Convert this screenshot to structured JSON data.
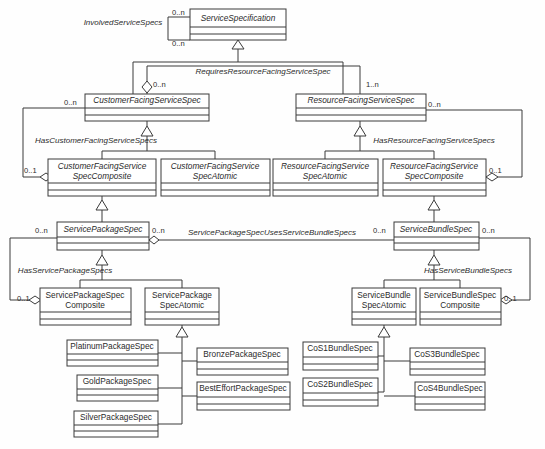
{
  "diagram": {
    "type": "uml-class-diagram",
    "background_color": "#fefefe",
    "line_color": "#3a3a3a",
    "classes": [
      {
        "id": "service-specification",
        "name": "ServiceSpecification",
        "abstract": true,
        "x": 190,
        "y": 9,
        "w": 96,
        "h": 31,
        "lines": [
          "ServiceSpecification"
        ]
      },
      {
        "id": "customer-facing-service-spec",
        "name": "CustomerFacingServiceSpec",
        "abstract": true,
        "x": 85,
        "y": 94,
        "w": 124,
        "h": 27,
        "lines": [
          "CustomerFacingServiceSpec"
        ]
      },
      {
        "id": "resource-facing-service-spec",
        "name": "ResourceFacingServiceSpec",
        "abstract": true,
        "x": 296,
        "y": 94,
        "w": 130,
        "h": 27,
        "lines": [
          "ResourceFacingServiceSpec"
        ]
      },
      {
        "id": "customer-facing-service-spec-composite",
        "name": "CustomerFacingServiceSpecComposite",
        "abstract": true,
        "x": 48,
        "y": 159,
        "w": 108,
        "h": 37,
        "lines": [
          "CustomerFacingService",
          "SpecComposite"
        ]
      },
      {
        "id": "customer-facing-service-spec-atomic",
        "name": "CustomerFacingServiceSpecAtomic",
        "abstract": true,
        "x": 161,
        "y": 159,
        "w": 109,
        "h": 37,
        "lines": [
          "CustomerFacingService",
          "SpecAtomic"
        ]
      },
      {
        "id": "resource-facing-service-spec-atomic",
        "name": "ResourceFacingServiceSpecAtomic",
        "abstract": true,
        "x": 273,
        "y": 159,
        "w": 105,
        "h": 37,
        "lines": [
          "ResourceFacingService",
          "SpecAtomic"
        ]
      },
      {
        "id": "resource-facing-service-spec-composite",
        "name": "ResourceFacingServiceSpecComposite",
        "abstract": true,
        "x": 383,
        "y": 159,
        "w": 103,
        "h": 37,
        "lines": [
          "ResourceFacingService",
          "SpecComposite"
        ]
      },
      {
        "id": "service-package-spec",
        "name": "ServicePackageSpec",
        "abstract": true,
        "x": 57,
        "y": 222,
        "w": 92,
        "h": 28,
        "lines": [
          "ServicePackageSpec"
        ]
      },
      {
        "id": "service-bundle-spec",
        "name": "ServiceBundleSpec",
        "abstract": true,
        "x": 394,
        "y": 222,
        "w": 85,
        "h": 28,
        "lines": [
          "ServiceBundleSpec"
        ]
      },
      {
        "id": "service-package-spec-composite",
        "name": "ServicePackageSpecComposite",
        "abstract": false,
        "x": 40,
        "y": 288,
        "w": 91,
        "h": 37,
        "lines": [
          "ServicePackageSpec",
          "Composite"
        ]
      },
      {
        "id": "service-package-spec-atomic",
        "name": "ServicePackageSpecAtomic",
        "abstract": false,
        "x": 145,
        "y": 288,
        "w": 74,
        "h": 37,
        "lines": [
          "ServicePackage",
          "SpecAtomic"
        ]
      },
      {
        "id": "service-bundle-spec-atomic",
        "name": "ServiceBundleSpecAtomic",
        "abstract": false,
        "x": 352,
        "y": 288,
        "w": 64,
        "h": 37,
        "lines": [
          "ServiceBundle",
          "SpecAtomic"
        ]
      },
      {
        "id": "service-bundle-spec-composite",
        "name": "ServiceBundleSpecComposite",
        "abstract": false,
        "x": 420,
        "y": 288,
        "w": 81,
        "h": 37,
        "lines": [
          "ServiceBundleSpec",
          "Composite"
        ]
      },
      {
        "id": "platinum-package-spec",
        "name": "PlatinumPackageSpec",
        "abstract": false,
        "x": 67,
        "y": 340,
        "w": 91,
        "h": 26,
        "lines": [
          "PlatinumPackageSpec"
        ]
      },
      {
        "id": "gold-package-spec",
        "name": "GoldPackageSpec",
        "abstract": false,
        "x": 77,
        "y": 375,
        "w": 81,
        "h": 26,
        "lines": [
          "GoldPackageSpec"
        ]
      },
      {
        "id": "silver-package-spec",
        "name": "SilverPackageSpec",
        "abstract": false,
        "x": 74,
        "y": 411,
        "w": 84,
        "h": 26,
        "lines": [
          "SilverPackageSpec"
        ]
      },
      {
        "id": "bronze-package-spec",
        "name": "BronzePackageSpec",
        "abstract": false,
        "x": 197,
        "y": 348,
        "w": 91,
        "h": 27,
        "lines": [
          "BronzePackageSpec"
        ]
      },
      {
        "id": "best-effort-package-spec",
        "name": "BestEffortPackageSpec",
        "abstract": false,
        "x": 197,
        "y": 382,
        "w": 93,
        "h": 28,
        "lines": [
          "BestEffortPackageSpec"
        ]
      },
      {
        "id": "cos1-bundle-spec",
        "name": "CoS1BundleSpec",
        "abstract": false,
        "x": 303,
        "y": 342,
        "w": 75,
        "h": 28,
        "lines": [
          "CoS1BundleSpec"
        ]
      },
      {
        "id": "cos2-bundle-spec",
        "name": "CoS2BundleSpec",
        "abstract": false,
        "x": 303,
        "y": 378,
        "w": 75,
        "h": 28,
        "lines": [
          "CoS2BundleSpec"
        ]
      },
      {
        "id": "cos3-bundle-spec",
        "name": "CoS3BundleSpec",
        "abstract": false,
        "x": 410,
        "y": 348,
        "w": 75,
        "h": 27,
        "lines": [
          "CoS3BundleSpec"
        ]
      },
      {
        "id": "cos4-bundle-spec",
        "name": "CoS4BundleSpec",
        "abstract": false,
        "x": 415,
        "y": 382,
        "w": 70,
        "h": 28,
        "lines": [
          "CoS4BundleSpec"
        ]
      }
    ],
    "associations": [
      {
        "id": "involved-service-specs",
        "label": "InvolvedServiceSpecs",
        "label_x": 123,
        "label_y": 23,
        "source_mult": "0..n",
        "target_mult": "0..n"
      },
      {
        "id": "requires-resource-facing-service-spec",
        "label": "RequiresResourceFacingServiceSpec",
        "label_x": 263,
        "label_y": 72,
        "source_mult": "0..n",
        "target_mult": "1..n"
      },
      {
        "id": "has-customer-facing-service-specs",
        "label": "HasCustomerFacingServiceSpecs",
        "label_x": 96,
        "label_y": 141,
        "source_mult": "0..n",
        "target_mult": "0..1"
      },
      {
        "id": "has-resource-facing-service-specs",
        "label": "HasResourceFacingServiceSpecs",
        "label_x": 434,
        "label_y": 141,
        "source_mult": "0..n",
        "target_mult": "0..1"
      },
      {
        "id": "service-package-spec-uses-service-bundle-specs",
        "label": "ServicePackageSpecUsesServiceBundleSpecs",
        "label_x": 272,
        "label_y": 233,
        "source_mult": "0..n",
        "target_mult": "0..n"
      },
      {
        "id": "has-service-package-specs",
        "label": "HasServicePackageSpecs",
        "label_x": 65,
        "label_y": 271,
        "source_mult": "0..n",
        "target_mult": "0..1"
      },
      {
        "id": "has-service-bundle-specs",
        "label": "HasServiceBundleSpecs",
        "label_x": 468,
        "label_y": 271,
        "source_mult": "0..n",
        "target_mult": "0..1"
      }
    ],
    "multiplicity_labels": [
      {
        "id": "mult-involved-top",
        "text": "0..n",
        "x": 172,
        "y": 13
      },
      {
        "id": "mult-involved-bottom",
        "text": "0..n",
        "x": 172,
        "y": 44
      },
      {
        "id": "mult-requires-source",
        "text": "0..n",
        "x": 147,
        "y": 85
      },
      {
        "id": "mult-requires-target",
        "text": "1..n",
        "x": 396,
        "y": 85
      },
      {
        "id": "mult-cfss-left",
        "text": "0..n",
        "x": 64,
        "y": 103
      },
      {
        "id": "mult-rfss-right",
        "text": "0..n",
        "x": 428,
        "y": 105
      },
      {
        "id": "mult-cfssc-left",
        "text": "0..1",
        "x": 24,
        "y": 171
      },
      {
        "id": "mult-rfssc-right",
        "text": "0..1",
        "x": 489,
        "y": 171
      },
      {
        "id": "mult-sps-left",
        "text": "0..n",
        "x": 35,
        "y": 231
      },
      {
        "id": "mult-sps-right",
        "text": "0..n",
        "x": 152,
        "y": 231
      },
      {
        "id": "mult-sbs-left",
        "text": "0..n",
        "x": 373,
        "y": 231
      },
      {
        "id": "mult-sbs-right",
        "text": "0..n",
        "x": 482,
        "y": 231
      },
      {
        "id": "mult-spsc-left",
        "text": "0..1",
        "x": 17,
        "y": 299
      },
      {
        "id": "mult-sbsc-right",
        "text": "0..1",
        "x": 504,
        "y": 299
      }
    ]
  }
}
